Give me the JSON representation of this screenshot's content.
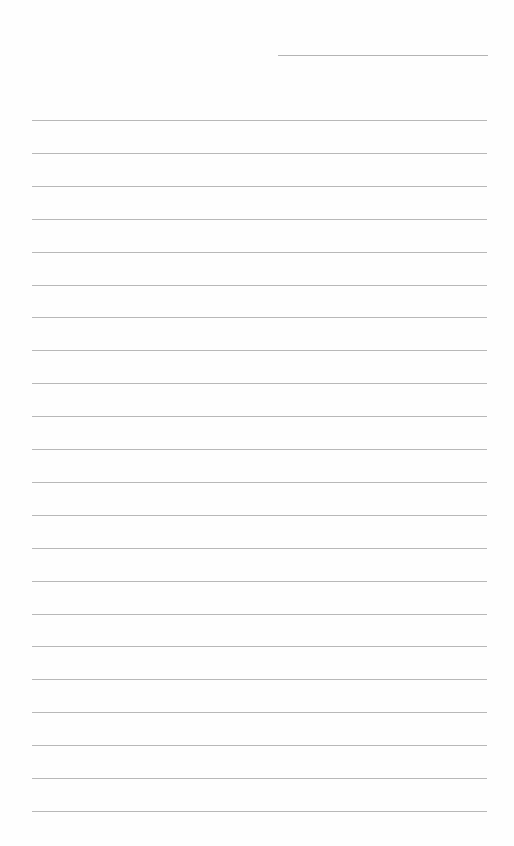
{
  "page": {
    "type": "blank lined writing sheet",
    "background": "#fefefe",
    "line_color": "#b8b8b8",
    "header_line": {
      "label": ""
    },
    "rules": {
      "count": 22,
      "first_y": 120,
      "spacing": 32.9,
      "lines": [
        "",
        "",
        "",
        "",
        "",
        "",
        "",
        "",
        "",
        "",
        "",
        "",
        "",
        "",
        "",
        "",
        "",
        "",
        "",
        "",
        "",
        ""
      ]
    }
  }
}
